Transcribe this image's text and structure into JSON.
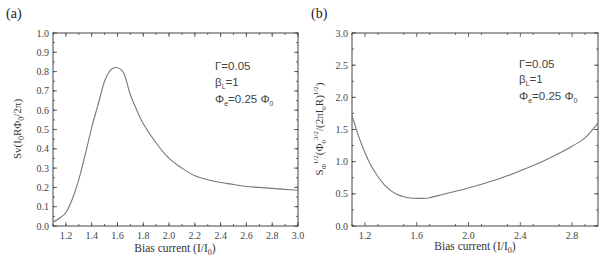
{
  "chart_data": [
    {
      "panel": "(a)",
      "type": "line",
      "title": "",
      "xlabel": "Bias current (I/I0)",
      "ylabel": "Sv(I0RΦ0/2π)",
      "xlim": [
        1.1,
        3.0
      ],
      "ylim": [
        0.0,
        1.0
      ],
      "grid": false,
      "x_ticks": [
        "1.2",
        "1.4",
        "1.6",
        "1.8",
        "2.0",
        "2.2",
        "2.4",
        "2.6",
        "2.8",
        "3.0"
      ],
      "y_ticks": [
        "0.0",
        "0.1",
        "0.2",
        "0.3",
        "0.4",
        "0.5",
        "0.6",
        "0.7",
        "0.8",
        "0.9",
        "1.0"
      ],
      "annotations": [
        "Γ=0.05",
        "βL=1",
        "Φe=0.25 Φ0"
      ],
      "series": [
        {
          "name": "Sv",
          "x": [
            1.1,
            1.15,
            1.2,
            1.25,
            1.3,
            1.35,
            1.4,
            1.45,
            1.5,
            1.55,
            1.6,
            1.65,
            1.7,
            1.75,
            1.8,
            1.9,
            2.0,
            2.1,
            2.2,
            2.3,
            2.4,
            2.5,
            2.6,
            2.7,
            2.8,
            2.9,
            3.0
          ],
          "y": [
            0.02,
            0.04,
            0.07,
            0.14,
            0.24,
            0.37,
            0.51,
            0.63,
            0.75,
            0.81,
            0.82,
            0.79,
            0.68,
            0.6,
            0.53,
            0.43,
            0.35,
            0.3,
            0.26,
            0.24,
            0.225,
            0.215,
            0.205,
            0.2,
            0.195,
            0.19,
            0.185
          ]
        }
      ]
    },
    {
      "panel": "(b)",
      "type": "line",
      "title": "",
      "xlabel": "Bias current (I/I0)",
      "ylabel": "SΦ^1/2(Φ0^3/2/(2πI0R)^1/2)",
      "xlim": [
        1.1,
        3.0
      ],
      "ylim": [
        0.0,
        3.0
      ],
      "grid": false,
      "x_ticks": [
        "1.2",
        "1.6",
        "2.0",
        "2.4",
        "2.8"
      ],
      "y_ticks": [
        "0.0",
        "0.5",
        "1.0",
        "1.5",
        "2.0",
        "2.5",
        "3.0"
      ],
      "annotations": [
        "Γ=0.05",
        "βL=1",
        "Φe=0.25 Φ0"
      ],
      "series": [
        {
          "name": "SΦ^1/2",
          "x": [
            1.1,
            1.15,
            1.2,
            1.25,
            1.3,
            1.35,
            1.4,
            1.45,
            1.5,
            1.55,
            1.6,
            1.65,
            1.7,
            1.8,
            1.9,
            2.0,
            2.1,
            2.2,
            2.3,
            2.4,
            2.5,
            2.6,
            2.7,
            2.8,
            2.9,
            3.0
          ],
          "y": [
            1.72,
            1.4,
            1.14,
            0.93,
            0.77,
            0.64,
            0.55,
            0.49,
            0.455,
            0.435,
            0.43,
            0.43,
            0.44,
            0.49,
            0.54,
            0.59,
            0.65,
            0.71,
            0.78,
            0.86,
            0.94,
            1.03,
            1.13,
            1.24,
            1.37,
            1.6
          ]
        }
      ]
    }
  ],
  "panels": {
    "a": {
      "label": "(a)",
      "xlabel_main": "Bias current (I/I",
      "xlabel_sub": "0",
      "xlabel_tail": ")",
      "annot_gamma": "Γ=0.05",
      "annot_beta": "β",
      "annot_beta_sub": "L",
      "annot_beta_val": "=1",
      "annot_phi": "Φ",
      "annot_phi_sub": "e",
      "annot_phi_val": "=0.25 Φ",
      "annot_phi_sub2": "0"
    },
    "b": {
      "label": "(b)",
      "xlabel_main": "Bias current (I/I",
      "xlabel_sub": "0",
      "xlabel_tail": ")",
      "annot_gamma": "Γ=0.05",
      "annot_beta": "β",
      "annot_beta_sub": "L",
      "annot_beta_val": "=1",
      "annot_phi": "Φ",
      "annot_phi_sub": "e",
      "annot_phi_val": "=0.25 Φ",
      "annot_phi_sub2": "0"
    }
  },
  "colors": {
    "curve": "#777777",
    "axis": "#444444",
    "text": "#333333"
  }
}
